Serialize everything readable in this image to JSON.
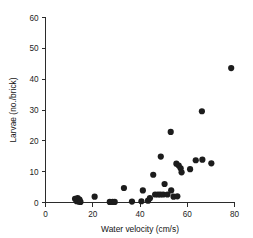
{
  "chart_data": {
    "type": "scatter",
    "title": "",
    "xlabel": "Water velocity (cm/s)",
    "ylabel": "Larvae (no./brick)",
    "xlim": [
      0,
      80
    ],
    "ylim": [
      0,
      60
    ],
    "xticks": [
      0,
      20,
      40,
      60,
      80
    ],
    "yticks": [
      0,
      10,
      20,
      30,
      40,
      50,
      60
    ],
    "xtick_labels": [
      "0",
      "20",
      "40",
      "60",
      "80"
    ],
    "ytick_labels": [
      "0",
      "10",
      "20",
      "30",
      "40",
      "50",
      "60"
    ],
    "grid": false,
    "legend": null,
    "marker": "filled-circle",
    "marker_color": "#1c1c1c",
    "marker_size": 3.1,
    "series": [
      {
        "name": "Larvae count per brick",
        "points": [
          [
            12.5,
            1.2
          ],
          [
            13.2,
            0.4
          ],
          [
            13.6,
            1.4
          ],
          [
            14.0,
            0.3
          ],
          [
            14.4,
            0.9
          ],
          [
            14.8,
            0.2
          ],
          [
            20.8,
            1.9
          ],
          [
            27.2,
            0.2
          ],
          [
            28.4,
            0.2
          ],
          [
            29.3,
            0.2
          ],
          [
            33.2,
            4.7
          ],
          [
            36.6,
            0.3
          ],
          [
            40.6,
            0.4
          ],
          [
            41.2,
            3.9
          ],
          [
            43.4,
            0.6
          ],
          [
            44.2,
            1.4
          ],
          [
            45.6,
            9.0
          ],
          [
            46.4,
            2.6
          ],
          [
            47.6,
            2.6
          ],
          [
            48.6,
            2.6
          ],
          [
            48.8,
            14.9
          ],
          [
            49.8,
            2.6
          ],
          [
            50.4,
            6.0
          ],
          [
            51.6,
            2.6
          ],
          [
            53.0,
            22.9
          ],
          [
            53.2,
            3.9
          ],
          [
            54.2,
            1.9
          ],
          [
            55.4,
            12.6
          ],
          [
            55.8,
            2.0
          ],
          [
            56.4,
            12.0
          ],
          [
            57.2,
            11.1
          ],
          [
            57.6,
            9.8
          ],
          [
            61.2,
            10.8
          ],
          [
            63.6,
            13.7
          ],
          [
            66.2,
            29.6
          ],
          [
            66.4,
            13.9
          ],
          [
            70.2,
            12.7
          ],
          [
            78.6,
            43.6
          ]
        ]
      }
    ]
  },
  "axes": {
    "x_title": "Water velocity (cm/s)",
    "y_title": "Larvae (no./brick)"
  }
}
